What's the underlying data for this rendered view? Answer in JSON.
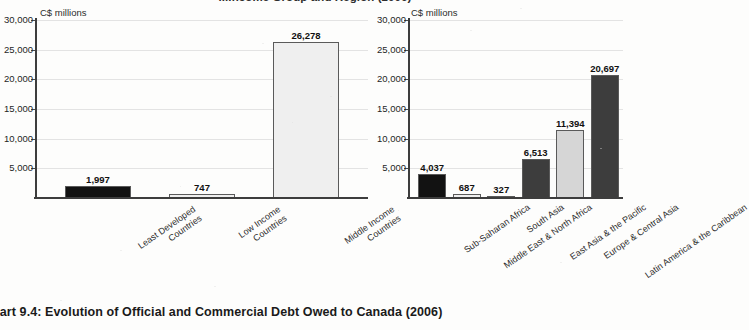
{
  "top_title": "...Income Group and Region (2006)",
  "caption": "hart 9.4: Evolution of Official and Commercial Debt Owed to Canada (2006)",
  "colors": {
    "black_bar": "#121212",
    "dark_gray_bar": "#3d3d3d",
    "light_gray_bar": "#d6d6d6",
    "pale_bar": "#efefef",
    "axis": "#3d3d3d",
    "grid": "#e3e3e3"
  },
  "chart_data": [
    {
      "type": "bar",
      "title": "Debt Owed to Canada by Income Group",
      "ylabel": "C$ millions",
      "xlabel": "",
      "ylim": [
        0,
        30000
      ],
      "yticks": [
        "5,000",
        "10,000",
        "15,000",
        "20,000",
        "25,000",
        "30,000"
      ],
      "ytick_values": [
        5000,
        10000,
        15000,
        20000,
        25000,
        30000
      ],
      "grid": true,
      "legend": "none",
      "categories": [
        [
          "Least Developed",
          "Countries"
        ],
        [
          "Low Income",
          "Countries"
        ],
        [
          "Middle Income",
          "Countries"
        ]
      ],
      "values": [
        1997,
        747,
        26278
      ],
      "value_labels": [
        "1,997",
        "747",
        "26,278"
      ],
      "bar_colors": [
        "#121212",
        "#efefef",
        "#efefef"
      ]
    },
    {
      "type": "bar",
      "title": "Debt Owed to Canada by Region",
      "ylabel": "C$ millions",
      "xlabel": "",
      "ylim": [
        0,
        30000
      ],
      "yticks": [
        "5,000",
        "10,000",
        "15,000",
        "20,000",
        "25,000",
        "30,000"
      ],
      "ytick_values": [
        5000,
        10000,
        15000,
        20000,
        25000,
        30000
      ],
      "grid": true,
      "legend": "none",
      "categories": [
        [
          "Sub-Saharan Africa"
        ],
        [
          "Middle East & North Africa"
        ],
        [
          "South Asia"
        ],
        [
          "East Asia & the Pacific"
        ],
        [
          "Europe & Central Asia"
        ],
        [
          "Latin America & the Caribbean"
        ]
      ],
      "values": [
        4037,
        687,
        327,
        6513,
        11394,
        20697
      ],
      "value_labels": [
        "4,037",
        "687",
        "327",
        "6,513",
        "11,394",
        "20,697"
      ],
      "bar_colors": [
        "#121212",
        "#efefef",
        "#d6d6d6",
        "#3d3d3d",
        "#d6d6d6",
        "#3d3d3d"
      ]
    }
  ]
}
